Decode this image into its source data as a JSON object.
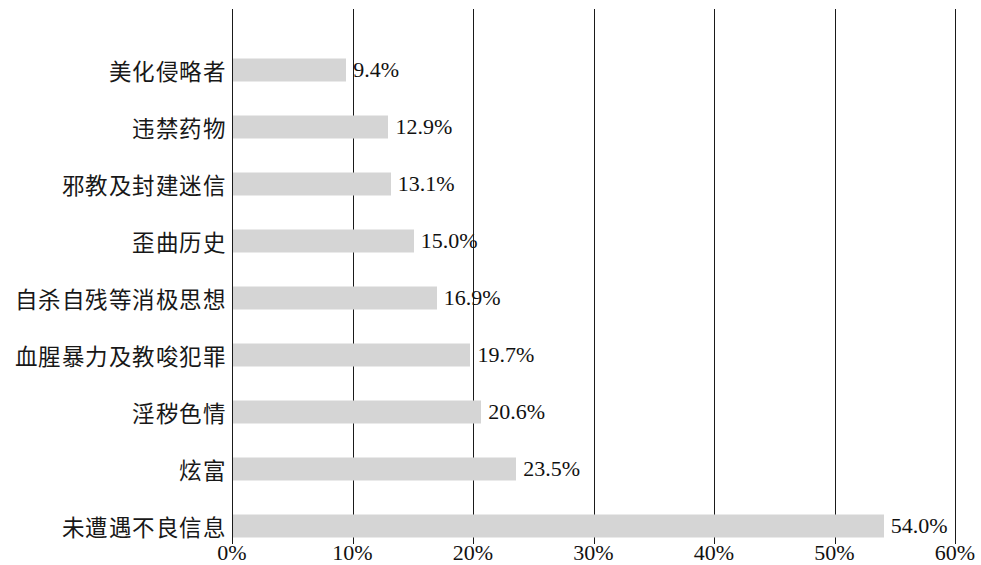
{
  "chart_data": {
    "type": "bar",
    "orientation": "horizontal",
    "title": "",
    "subtitle": "",
    "xlabel": "",
    "ylabel": "",
    "xlim": [
      0,
      60
    ],
    "xtick_step": 10,
    "grid": true,
    "legend": false,
    "bar_color": "#d5d5d5",
    "axis_color": "#1a1a1a",
    "text_color": "#111111",
    "categories": [
      "美化侵略者",
      "违禁药物",
      "邪教及封建迷信",
      "歪曲历史",
      "自杀自残等消极思想",
      "血腥暴力及教唆犯罪",
      "淫秽色情",
      "炫富",
      "未遭遇不良信息"
    ],
    "values": [
      9.4,
      12.9,
      13.1,
      15.0,
      16.9,
      19.7,
      20.6,
      23.5,
      54.0
    ],
    "value_labels": [
      "9.4%",
      "12.9%",
      "13.1%",
      "15.0%",
      "16.9%",
      "19.7%",
      "20.6%",
      "23.5%",
      "54.0%"
    ],
    "xtick_labels": [
      "0%",
      "10%",
      "20%",
      "30%",
      "40%",
      "50%",
      "60%"
    ],
    "xtick_values": [
      0,
      10,
      20,
      30,
      40,
      50,
      60
    ]
  }
}
